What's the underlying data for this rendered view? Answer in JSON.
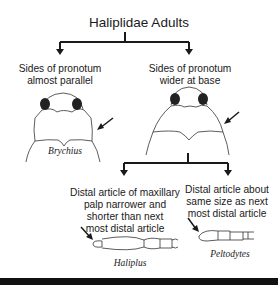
{
  "title": "Haliplidae Adults",
  "branch1": {
    "left": {
      "label_line1": "Sides of pronotum",
      "label_line2": "almost parallel",
      "genus": "Brychius"
    },
    "right": {
      "label_line1": "Sides of pronotum",
      "label_line2": "wider at base"
    }
  },
  "branch2": {
    "left": {
      "label_line1": "Distal article of maxillary",
      "label_line2": "palp narrower and",
      "label_line3": "shorter than next",
      "label_line4": "most distal article",
      "genus": "Haliplus"
    },
    "right": {
      "label_line1": "Distal article about",
      "label_line2": "same size as next",
      "label_line3": "most distal article",
      "genus": "Peltodytes"
    }
  },
  "colors": {
    "line": "#1a1a1a",
    "background": "#ffffff",
    "footer_bar": "#111111"
  }
}
